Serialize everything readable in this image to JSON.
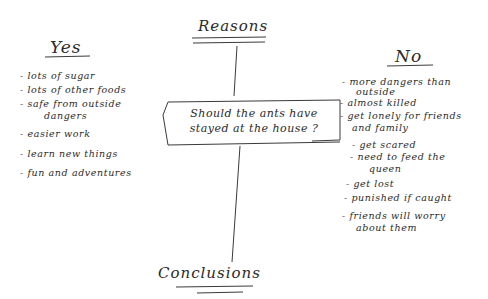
{
  "diagram": {
    "top_heading": "Reasons",
    "bottom_heading": "Conclusions",
    "central_question": {
      "line1": "Should the ants have",
      "line2": "stayed at the house ?"
    },
    "yes_column": {
      "heading": "Yes",
      "items": [
        {
          "lines": [
            "- lots of sugar"
          ]
        },
        {
          "lines": [
            "- lots of other foods"
          ]
        },
        {
          "lines": [
            "- safe from outside",
            "dangers"
          ]
        },
        {
          "lines": [
            "- easier work"
          ]
        },
        {
          "lines": [
            "- learn new things"
          ]
        },
        {
          "lines": [
            "- fun and adventures"
          ]
        }
      ]
    },
    "no_column": {
      "heading": "No",
      "items": [
        {
          "lines": [
            "- more dangers than",
            "outside"
          ]
        },
        {
          "lines": [
            "- almost killed"
          ]
        },
        {
          "lines": [
            "- get lonely for friends",
            "and family"
          ]
        },
        {
          "lines": [
            "- get scared"
          ]
        },
        {
          "lines": [
            "- need to feed the",
            "queen"
          ]
        },
        {
          "lines": [
            "- get lost"
          ]
        },
        {
          "lines": [
            "- punished if caught"
          ]
        },
        {
          "lines": [
            "- friends will worry",
            "about them"
          ]
        }
      ]
    }
  }
}
